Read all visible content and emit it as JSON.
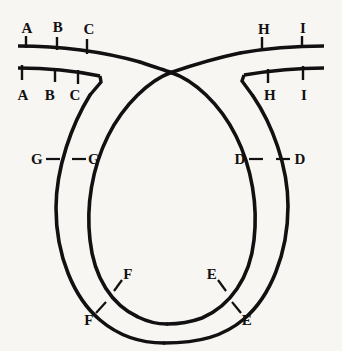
{
  "figure": {
    "background_color": "#f7f6f3",
    "stroke_color": "#111111",
    "width": 342,
    "height": 351
  },
  "labels": {
    "upper_left_outer": [
      {
        "text": "A",
        "x": 27,
        "y": 28
      },
      {
        "text": "B",
        "x": 58,
        "y": 27
      },
      {
        "text": "C",
        "x": 89,
        "y": 29
      }
    ],
    "upper_left_inner": [
      {
        "text": "A",
        "x": 23,
        "y": 95
      },
      {
        "text": "B",
        "x": 50,
        "y": 95
      },
      {
        "text": "C",
        "x": 75,
        "y": 95
      }
    ],
    "upper_right_outer": [
      {
        "text": "H",
        "x": 264,
        "y": 29
      },
      {
        "text": "I",
        "x": 303,
        "y": 28
      }
    ],
    "upper_right_inner": [
      {
        "text": "H",
        "x": 270,
        "y": 95
      },
      {
        "text": "I",
        "x": 304,
        "y": 95
      }
    ],
    "mid_left": [
      {
        "text": "G",
        "x": 37,
        "y": 159
      },
      {
        "text": "G",
        "x": 94,
        "y": 159
      }
    ],
    "mid_right": [
      {
        "text": "D",
        "x": 240,
        "y": 159
      },
      {
        "text": "D",
        "x": 300,
        "y": 159
      }
    ],
    "bottom_left": [
      {
        "text": "F",
        "x": 128,
        "y": 274
      },
      {
        "text": "F",
        "x": 89,
        "y": 320
      }
    ],
    "bottom_right": [
      {
        "text": "E",
        "x": 212,
        "y": 274
      },
      {
        "text": "E",
        "x": 247,
        "y": 320
      }
    ]
  },
  "geometry": {
    "outer_loop": "M 20,46 C 70,47 118,58 152,66 C 163,69 168,71 171,72 C 196,77 226,106 242,144 C 262,192 258,250 228,294 C 208,323 182,337 160,337 C 136,337 110,322 90,292 C 62,250 56,196 68,152 C 78,114 96,88 110,80",
    "outer_tail_right": "M 171,72 C 200,67 240,56 278,50 C 298,47 312,46 322,46",
    "inner_loop": "M 20,70 C 52,70 84,72 106,76 C 114,78 110,80 110,80 L 100,82 C 112,88 130,104 142,120",
    "crossing_point": {
      "x": 171,
      "y": 72
    },
    "left_notch": {
      "x": 100,
      "y": 82
    },
    "right_notch": {
      "x": 243,
      "y": 80
    }
  },
  "ticks": {
    "upper_left": [
      {
        "x": 26,
        "y1": 36,
        "y2": 48
      },
      {
        "x": 57,
        "y1": 37,
        "y2": 49
      },
      {
        "x": 87,
        "y1": 39,
        "y2": 52
      }
    ],
    "upper_right": [
      {
        "x": 262,
        "y1": 37,
        "y2": 50
      },
      {
        "x": 302,
        "y1": 36,
        "y2": 48
      }
    ],
    "lower_left": [
      {
        "x": 22,
        "y1": 66,
        "y2": 80
      },
      {
        "x": 55,
        "y1": 68,
        "y2": 82
      },
      {
        "x": 78,
        "y1": 70,
        "y2": 84
      }
    ],
    "lower_right": [
      {
        "x": 268,
        "y1": 68,
        "y2": 82
      },
      {
        "x": 303,
        "y1": 66,
        "y2": 80
      }
    ]
  }
}
